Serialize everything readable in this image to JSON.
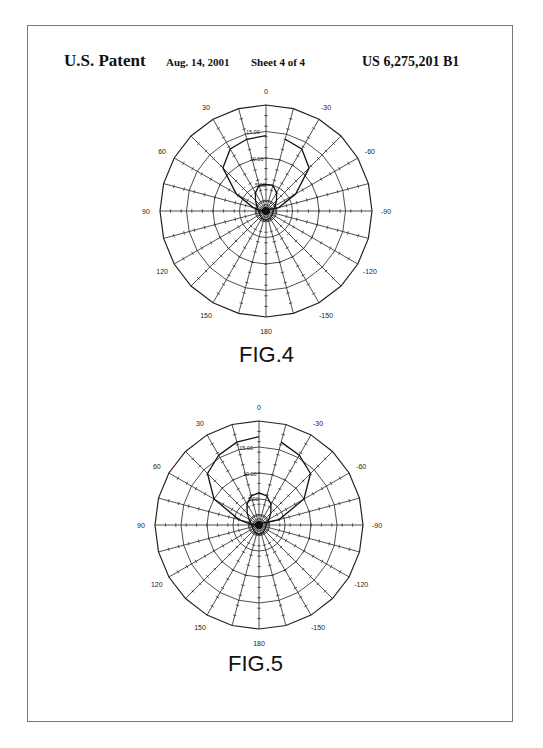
{
  "header": {
    "title": "U.S. Patent",
    "date": "Aug. 14, 2001",
    "sheet": "Sheet 4 of 4",
    "patent_number": "US 6,275,201 B1"
  },
  "chart_data": [
    {
      "type": "polar",
      "title": "FIG.4",
      "angle_labels": [
        "0",
        "-30",
        "-60",
        "-90",
        "-120",
        "-150",
        "180",
        "150",
        "120",
        "90",
        "60",
        "30"
      ],
      "angle_label_values": [
        0,
        -30,
        -60,
        -90,
        -120,
        -150,
        180,
        150,
        120,
        90,
        60,
        30
      ],
      "radial_labels": [
        "0.00",
        "5.00",
        "10.00",
        "15.00"
      ],
      "radial_values": [
        0,
        5,
        10,
        15
      ],
      "rmax": 20,
      "spoke_step_deg": 15,
      "grid": true,
      "series": [
        {
          "name": "outer-pattern",
          "angles": [
            0,
            15,
            30,
            45,
            60,
            75,
            90,
            -75,
            -60,
            -45,
            -30,
            -15
          ],
          "values": [
            14.2,
            14.0,
            13.5,
            11.5,
            6.5,
            2.5,
            1.0,
            2.5,
            6.5,
            11.5,
            13.5,
            14.0
          ]
        },
        {
          "name": "inner-lobe",
          "angles": [
            0,
            15,
            30,
            45,
            60,
            90,
            120,
            150,
            180,
            -150,
            -120,
            -90,
            -60,
            -45,
            -30,
            -15
          ],
          "values": [
            5.0,
            5.0,
            4.0,
            2.8,
            2.0,
            1.4,
            1.4,
            1.6,
            1.7,
            1.6,
            1.4,
            1.4,
            2.0,
            2.8,
            4.0,
            5.0
          ]
        }
      ]
    },
    {
      "type": "polar",
      "title": "FIG.5",
      "angle_labels": [
        "0",
        "-30",
        "-60",
        "-90",
        "-120",
        "-150",
        "180",
        "150",
        "120",
        "90",
        "60",
        "30"
      ],
      "angle_label_values": [
        0,
        -30,
        -60,
        -90,
        -120,
        -150,
        180,
        150,
        120,
        90,
        60,
        30
      ],
      "radial_labels": [
        "0.00",
        "5.00",
        "10.00",
        "15.00"
      ],
      "radial_values": [
        0,
        5,
        10,
        15
      ],
      "rmax": 20,
      "spoke_step_deg": 15,
      "grid": true,
      "series": [
        {
          "name": "outer-pattern",
          "angles": [
            0,
            15,
            30,
            45,
            60,
            75,
            90,
            -75,
            -60,
            -45,
            -30,
            -15
          ],
          "values": [
            17.0,
            16.5,
            15.5,
            14.0,
            10.0,
            4.0,
            1.2,
            4.0,
            10.0,
            14.0,
            15.5,
            16.5
          ]
        },
        {
          "name": "inner-lobe",
          "angles": [
            0,
            15,
            30,
            45,
            60,
            90,
            120,
            150,
            180,
            -150,
            -120,
            -90,
            -60,
            -45,
            -30,
            -15
          ],
          "values": [
            6.2,
            5.8,
            4.6,
            3.2,
            2.2,
            1.4,
            1.4,
            1.6,
            1.8,
            1.6,
            1.4,
            1.4,
            2.2,
            3.2,
            4.6,
            5.8
          ]
        }
      ]
    }
  ]
}
